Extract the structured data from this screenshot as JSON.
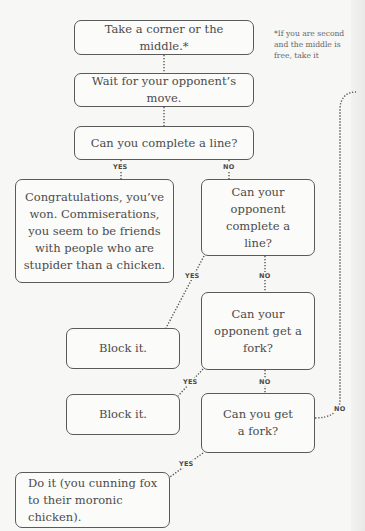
{
  "diagram": {
    "type": "flowchart",
    "topic": "Tic-tac-toe strategy",
    "note": "*If you are second and the middle is free, take it",
    "nodes": [
      {
        "id": "start",
        "text": "Take a corner or the middle.*"
      },
      {
        "id": "wait",
        "text": "Wait for your opponent’s move."
      },
      {
        "id": "q_complete",
        "text": "Can you complete a line?"
      },
      {
        "id": "won",
        "text": "Congratulations, you’ve won. Commiserations, you seem to be friends with people who are stupider than a chicken."
      },
      {
        "id": "q_opp_complete",
        "text": "Can your opponent complete a line?"
      },
      {
        "id": "block1",
        "text": "Block it."
      },
      {
        "id": "q_opp_fork",
        "text": "Can your opponent get a fork?"
      },
      {
        "id": "block2",
        "text": "Block it."
      },
      {
        "id": "q_fork",
        "text": "Can you get a fork?"
      },
      {
        "id": "do_it",
        "text": "Do it (you cunning fox to their moronic chicken)."
      }
    ],
    "edges": [
      {
        "from": "start",
        "to": "wait",
        "label": ""
      },
      {
        "from": "wait",
        "to": "q_complete",
        "label": ""
      },
      {
        "from": "q_complete",
        "to": "won",
        "label": "YES"
      },
      {
        "from": "q_complete",
        "to": "q_opp_complete",
        "label": "NO"
      },
      {
        "from": "q_opp_complete",
        "to": "block1",
        "label": "YES"
      },
      {
        "from": "q_opp_complete",
        "to": "q_opp_fork",
        "label": "NO"
      },
      {
        "from": "q_opp_fork",
        "to": "block2",
        "label": "YES"
      },
      {
        "from": "q_opp_fork",
        "to": "q_fork",
        "label": "NO"
      },
      {
        "from": "q_fork",
        "to": "do_it",
        "label": "YES"
      },
      {
        "from": "q_fork",
        "to": "continues-off-page",
        "label": "NO"
      }
    ],
    "labels": {
      "yes": "YES",
      "no": "NO"
    },
    "colors": {
      "background": "#f7f7f5",
      "box_border": "#5a5a5a",
      "text": "#4b4b4b",
      "connector": "#555555"
    }
  }
}
